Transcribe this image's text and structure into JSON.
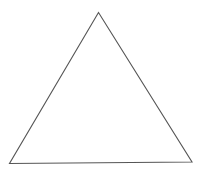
{
  "diagram": {
    "type": "geometric-figure",
    "shape": "triangle",
    "width": 202,
    "height": 177,
    "background_color": "#ffffff",
    "stroke_color": "#555555",
    "stroke_width": 1.1,
    "fill": "none",
    "vertices": [
      {
        "name": "apex",
        "x": 98.5,
        "y": 12.5
      },
      {
        "name": "bottom-left",
        "x": 9.5,
        "y": 163.5
      },
      {
        "name": "bottom-right",
        "x": 192,
        "y": 162
      }
    ],
    "labels": []
  }
}
